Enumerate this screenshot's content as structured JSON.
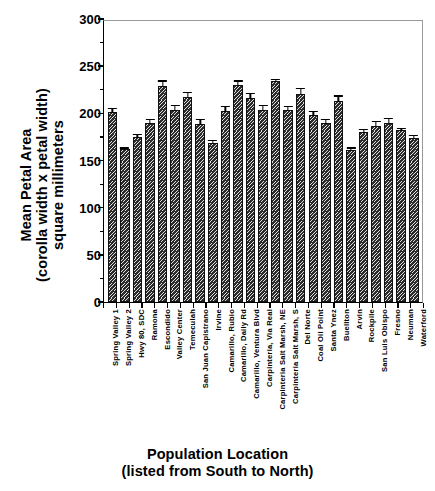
{
  "chart_data": {
    "type": "bar",
    "title": "",
    "ylabel_lines": [
      "Mean Petal Area",
      "(corolla width x petal width)",
      "square millimeters"
    ],
    "xlabel_lines": [
      "Population Location",
      "(listed from South to North)"
    ],
    "ylim": [
      0,
      300
    ],
    "ytick_values": [
      0,
      50,
      100,
      150,
      200,
      250,
      300
    ],
    "ytick_labels": [
      "0",
      "50",
      "100",
      "150",
      "200",
      "250",
      "300"
    ],
    "yminor_step": 25,
    "grid": false,
    "legend": "none",
    "bar_color": "#2b2b2b",
    "bar_pattern": "diagonal-hatch",
    "error_bars": true,
    "categories": [
      "Spring Valley 1",
      "Spring Valley 2",
      "Hwy 80, SDC",
      "Ramona",
      "Escondido",
      "Valley Center",
      "Temeculah",
      "San Juan Capistrano",
      "Irvine",
      "Camarillo, Rubio",
      "Camarillo, Daily Rd",
      "Camarillo, Ventura Blvd",
      "Carpinteria, Via Real",
      "Carpinteria Salt Marsh, NE",
      "Carpinteria Salt Marsh, S",
      "Del Norte",
      "Coal Oil Point",
      "Santa Ynez",
      "Buellton",
      "Arvin",
      "Rockpile",
      "San Luis Obispo",
      "Fresno",
      "Neuman",
      "Waterford"
    ],
    "values": [
      201,
      162,
      175,
      190,
      229,
      204,
      217,
      189,
      169,
      203,
      230,
      216,
      204,
      234,
      204,
      221,
      198,
      190,
      213,
      161,
      180,
      187,
      190,
      182,
      174
    ],
    "errors": [
      6,
      3,
      4,
      5,
      7,
      6,
      7,
      6,
      4,
      6,
      6,
      7,
      6,
      4,
      5,
      7,
      6,
      5,
      7,
      4,
      5,
      6,
      6,
      4,
      4
    ]
  }
}
